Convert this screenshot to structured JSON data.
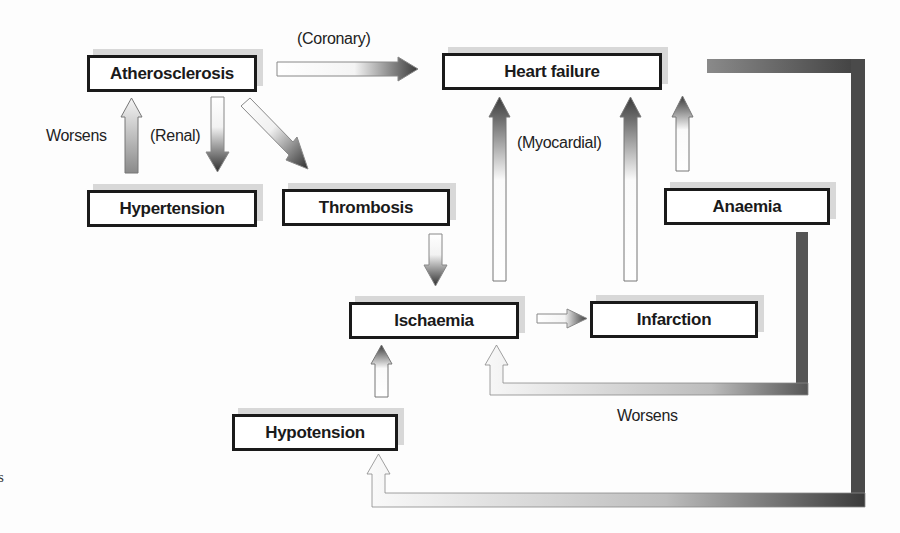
{
  "diagram": {
    "nodes": {
      "atherosclerosis": "Atherosclerosis",
      "heart_failure": "Heart failure",
      "hypertension": "Hypertension",
      "thrombosis": "Thrombosis",
      "anaemia": "Anaemia",
      "ischaemia": "Ischaemia",
      "infarction": "Infarction",
      "hypotension": "Hypotension"
    },
    "labels": {
      "coronary": "(Coronary)",
      "renal": "(Renal)",
      "worsens_left": "Worsens",
      "myocardial": "(Myocardial)",
      "worsens_bottom": "Worsens"
    },
    "edges": [
      {
        "from": "Atherosclerosis",
        "to": "Heart failure",
        "label": "(Coronary)"
      },
      {
        "from": "Atherosclerosis",
        "to": "Hypertension",
        "label": "(Renal)"
      },
      {
        "from": "Hypertension",
        "to": "Atherosclerosis",
        "label": "Worsens"
      },
      {
        "from": "Atherosclerosis",
        "to": "Thrombosis",
        "label": ""
      },
      {
        "from": "Thrombosis",
        "to": "Ischaemia",
        "label": ""
      },
      {
        "from": "Ischaemia",
        "to": "Heart failure",
        "label": "(Myocardial)"
      },
      {
        "from": "Ischaemia",
        "to": "Infarction",
        "label": ""
      },
      {
        "from": "Infarction",
        "to": "Heart failure",
        "label": ""
      },
      {
        "from": "Anaemia",
        "to": "Heart failure",
        "label": ""
      },
      {
        "from": "Anaemia",
        "to": "Ischaemia",
        "label": "Worsens"
      },
      {
        "from": "Hypotension",
        "to": "Ischaemia",
        "label": ""
      },
      {
        "from": "Heart failure",
        "to": "Hypotension",
        "label": ""
      }
    ],
    "margin_fragment": "s"
  }
}
